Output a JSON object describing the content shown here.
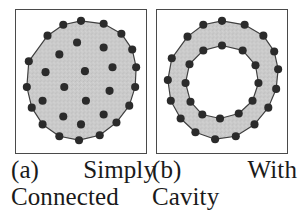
{
  "figure": {
    "background_color": "#ffffff",
    "fill_color": "#c9c9c9",
    "node_color": "#2b2b2b",
    "outline_color": "#3a3a3a",
    "frame_color": "#4a4a4a"
  },
  "panels": [
    {
      "id": "a",
      "label_tag": "(a)",
      "label_word1": "Simply",
      "label_word2": "Connected",
      "shape": "simply-connected-polygon",
      "boundary_node_count": 16,
      "interior_node_count": 12,
      "boundary_nodes": [
        [
          66,
          11
        ],
        [
          89,
          14
        ],
        [
          107,
          24
        ],
        [
          118,
          40
        ],
        [
          122,
          58
        ],
        [
          121,
          78
        ],
        [
          115,
          97
        ],
        [
          102,
          114
        ],
        [
          85,
          127
        ],
        [
          64,
          132
        ],
        [
          44,
          128
        ],
        [
          27,
          116
        ],
        [
          16,
          99
        ],
        [
          11,
          78
        ],
        [
          13,
          52
        ],
        [
          32,
          26
        ],
        [
          48,
          15
        ]
      ],
      "interior_nodes": [
        [
          62,
          33
        ],
        [
          89,
          38
        ],
        [
          44,
          45
        ],
        [
          98,
          58
        ],
        [
          30,
          63
        ],
        [
          70,
          62
        ],
        [
          49,
          78
        ],
        [
          95,
          82
        ],
        [
          27,
          92
        ],
        [
          71,
          92
        ],
        [
          89,
          106
        ],
        [
          48,
          108
        ],
        [
          66,
          116
        ]
      ]
    },
    {
      "id": "b",
      "label_tag": "(b)",
      "label_word1": "With",
      "label_word2": "Cavity",
      "shape": "annulus-with-cavity",
      "outer_node_count": 16,
      "inner_node_count": 12,
      "outer_nodes": [
        [
          66,
          11
        ],
        [
          89,
          15
        ],
        [
          108,
          26
        ],
        [
          119,
          42
        ],
        [
          123,
          60
        ],
        [
          121,
          80
        ],
        [
          113,
          99
        ],
        [
          99,
          116
        ],
        [
          80,
          128
        ],
        [
          59,
          131
        ],
        [
          39,
          124
        ],
        [
          24,
          110
        ],
        [
          14,
          92
        ],
        [
          11,
          71
        ],
        [
          15,
          49
        ],
        [
          31,
          27
        ],
        [
          47,
          15
        ]
      ],
      "inner_nodes": [
        [
          66,
          36
        ],
        [
          87,
          41
        ],
        [
          100,
          56
        ],
        [
          103,
          74
        ],
        [
          97,
          92
        ],
        [
          83,
          105
        ],
        [
          64,
          110
        ],
        [
          46,
          106
        ],
        [
          34,
          93
        ],
        [
          29,
          74
        ],
        [
          33,
          55
        ],
        [
          47,
          41
        ]
      ]
    }
  ]
}
